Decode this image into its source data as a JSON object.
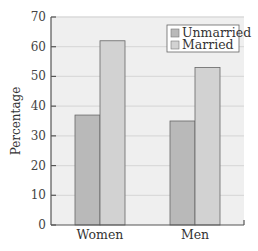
{
  "chart_data": {
    "type": "bar",
    "title": "",
    "xlabel": "",
    "ylabel": "Percentage",
    "categories": [
      "Women",
      "Men"
    ],
    "series": [
      {
        "name": "Unmarried",
        "values": [
          37,
          35
        ],
        "color": "#b9b9b9"
      },
      {
        "name": "Married",
        "values": [
          62,
          53
        ],
        "color": "#d2d2d2"
      }
    ],
    "ylim": [
      0,
      70
    ],
    "yticks": [
      0,
      10,
      20,
      30,
      40,
      50,
      60,
      70
    ],
    "grid": true,
    "legend_position": "upper right"
  },
  "colors": {
    "plot_background": "#efefef",
    "gridline": "#dadada",
    "axis": "#555555",
    "bar_edge": "#666666"
  }
}
